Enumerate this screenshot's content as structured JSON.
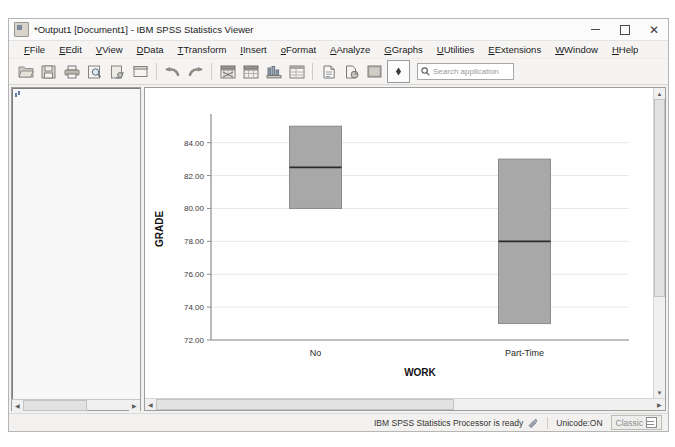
{
  "window": {
    "title": "*Output1 [Document1] - IBM SPSS Statistics Viewer",
    "app_icon": "spss-viewer-icon",
    "minimize": "–",
    "maximize": "□",
    "close": "✕"
  },
  "menubar": {
    "items": [
      {
        "label": "File",
        "mnemonic": "F"
      },
      {
        "label": "Edit",
        "mnemonic": "E"
      },
      {
        "label": "View",
        "mnemonic": "V"
      },
      {
        "label": "Data",
        "mnemonic": "D"
      },
      {
        "label": "Transform",
        "mnemonic": "T"
      },
      {
        "label": "Insert",
        "mnemonic": "I"
      },
      {
        "label": "Format",
        "mnemonic": "o"
      },
      {
        "label": "Analyze",
        "mnemonic": "A"
      },
      {
        "label": "Graphs",
        "mnemonic": "G"
      },
      {
        "label": "Utilities",
        "mnemonic": "U"
      },
      {
        "label": "Extensions",
        "mnemonic": "x"
      },
      {
        "label": "Window",
        "mnemonic": "W"
      },
      {
        "label": "Help",
        "mnemonic": "H"
      }
    ]
  },
  "toolbar": {
    "buttons": [
      "open-file-icon",
      "save-icon",
      "print-icon",
      "print-preview-icon",
      "export-icon",
      "dialog-recall-icon",
      "undo-icon",
      "redo-icon",
      "goto-data-icon",
      "goto-case-icon",
      "insert-chart-icon",
      "insert-table-icon",
      "insert-text-icon",
      "insert-object-icon",
      "show-hide-icon",
      "promote-icon"
    ]
  },
  "search": {
    "icon": "search-icon",
    "placeholder": "Search application",
    "value": ""
  },
  "outline": {
    "nodes": [
      {
        "label": "Output",
        "indent": 0,
        "expander": "-",
        "icon": "output-book-icon"
      },
      {
        "label": "Explore",
        "indent": 1,
        "expander": "-",
        "icon": "output-book-icon"
      },
      {
        "label": "Title",
        "indent": 2,
        "expander": "",
        "icon": "title-page-icon"
      },
      {
        "label": "Notes",
        "indent": 2,
        "expander": "",
        "icon": "notes-table-icon"
      },
      {
        "label": "WORK",
        "indent": 2,
        "expander": "-",
        "icon": "output-book-icon"
      },
      {
        "label": "Title",
        "indent": 3,
        "expander": "",
        "icon": "title-page-icon"
      },
      {
        "label": "Case Process",
        "indent": 3,
        "expander": "",
        "icon": "notes-table-icon"
      },
      {
        "label": "Descriptives",
        "indent": 3,
        "expander": "",
        "icon": "notes-table-icon"
      },
      {
        "label": "GRADE",
        "indent": 3,
        "expander": "-",
        "icon": "output-book-icon"
      },
      {
        "label": "Title",
        "indent": 4,
        "expander": "",
        "icon": "title-page-icon"
      },
      {
        "label": "Stem-and",
        "indent": 4,
        "expander": "-",
        "icon": "output-book-icon"
      },
      {
        "label": "Title",
        "indent": 5,
        "expander": "",
        "icon": "title-page-icon"
      },
      {
        "label": "WOR",
        "indent": 5,
        "expander": "",
        "icon": "chart-node-icon"
      },
      {
        "label": "WOR",
        "indent": 5,
        "expander": "",
        "icon": "chart-node-icon"
      },
      {
        "label": "Boxplot",
        "indent": 4,
        "expander": "",
        "icon": "chart-node-icon"
      }
    ]
  },
  "statusbar": {
    "processor": "IBM SPSS Statistics Processor is ready",
    "indicator_icon": "processor-status-icon",
    "unicode": "Unicode:ON",
    "mode": "Classic",
    "mode_icon": "classic-grid-icon"
  },
  "chart_data": {
    "type": "boxplot",
    "title": "",
    "xlabel": "WORK",
    "ylabel": "GRADE",
    "categories": [
      "No",
      "Part-Time"
    ],
    "ylim": [
      72.0,
      85.5
    ],
    "yticks": [
      "72.00",
      "74.00",
      "76.00",
      "78.00",
      "80.00",
      "82.00",
      "84.00"
    ],
    "ytick_values": [
      72.0,
      74.0,
      76.0,
      78.0,
      80.0,
      82.0,
      84.0
    ],
    "grid": true,
    "legend": "none",
    "box_fill": "#a8a8a8",
    "box_stroke": "#8a8a8a",
    "median_color": "#2b2b2b",
    "boxes": [
      {
        "category": "No",
        "q1": 80.0,
        "median": 82.5,
        "q3": 85.0,
        "whisker_low": 80.0,
        "whisker_high": 85.0
      },
      {
        "category": "Part-Time",
        "q1": 73.0,
        "median": 78.0,
        "q3": 83.0,
        "whisker_low": 73.0,
        "whisker_high": 83.0
      }
    ]
  }
}
